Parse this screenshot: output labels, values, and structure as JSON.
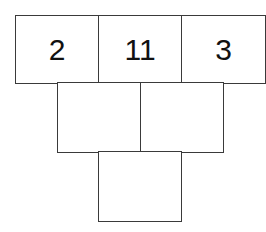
{
  "pyramid": {
    "rows": [
      {
        "cells": [
          {
            "value": "2"
          },
          {
            "value": "11"
          },
          {
            "value": "3"
          }
        ]
      },
      {
        "cells": [
          {
            "value": ""
          },
          {
            "value": ""
          }
        ]
      },
      {
        "cells": [
          {
            "value": ""
          }
        ]
      }
    ]
  },
  "colors": {
    "border": "#3a3a3a",
    "text": "#111111",
    "background": "#ffffff"
  }
}
